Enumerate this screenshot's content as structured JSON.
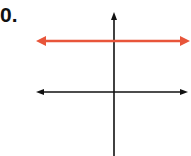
{
  "problem": {
    "number_label": "0."
  },
  "graph": {
    "axes": {
      "x_axis": {
        "y": 92,
        "x_start": 36,
        "x_end": 188,
        "color": "#111111"
      },
      "y_axis": {
        "x": 114,
        "y_start": 12,
        "y_end": 156,
        "color": "#111111"
      }
    },
    "lines": [
      {
        "type": "horizontal",
        "y": 41,
        "x_start": 36,
        "x_end": 188,
        "color": "#e8553a",
        "description": "horizontal line above x-axis, crossing y-axis"
      }
    ]
  }
}
